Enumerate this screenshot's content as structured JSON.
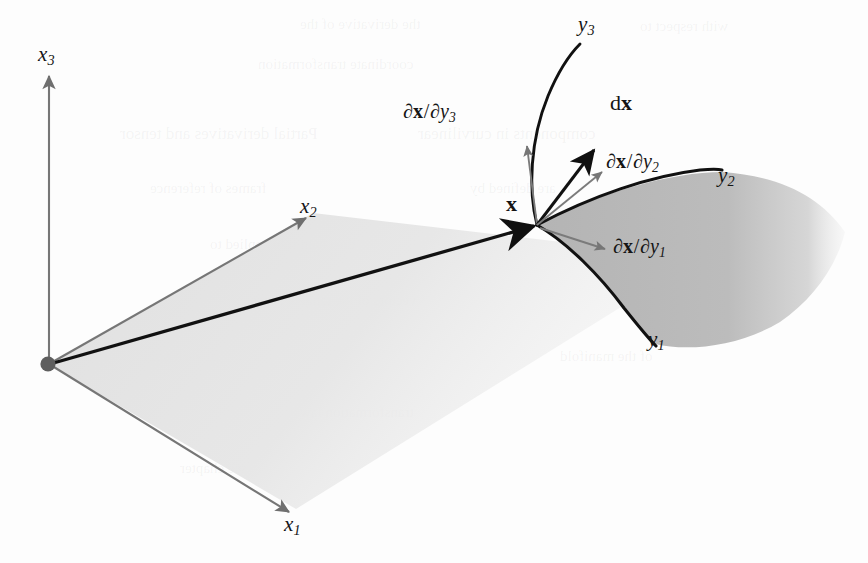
{
  "figure": {
    "kind": "mathematical-diagram",
    "background_color": "#fdfdfd",
    "ink_color": "#151515",
    "axis_color": "#6e6e6e",
    "surface_fill": "#b9b9b9",
    "plane_fill": "#e3e3e3"
  },
  "axes": [
    {
      "name": "x1",
      "base": "x",
      "sub": "1",
      "color": "#7a7a7a"
    },
    {
      "name": "x2",
      "base": "x",
      "sub": "2",
      "color": "#7a7a7a"
    },
    {
      "name": "x3",
      "base": "x",
      "sub": "3",
      "color": "#7a7a7a"
    }
  ],
  "labels": {
    "x1": {
      "base": "x",
      "sub": "1"
    },
    "x2": {
      "base": "x",
      "sub": "2"
    },
    "x3": {
      "base": "x",
      "sub": "3"
    },
    "y1": {
      "base": "y",
      "sub": "1"
    },
    "y2": {
      "base": "y",
      "sub": "2"
    },
    "y3": {
      "base": "y",
      "sub": "3"
    },
    "point_x": "x",
    "differential": {
      "d": "d",
      "vec": "x"
    },
    "tangent_1": {
      "partial": "∂",
      "vec": "x",
      "slash": "/",
      "denom_base": "y",
      "denom_sub": "1"
    },
    "tangent_2": {
      "partial": "∂",
      "vec": "x",
      "slash": "/",
      "denom_base": "y",
      "denom_sub": "2"
    },
    "tangent_3": {
      "partial": "∂",
      "vec": "x",
      "slash": "/",
      "denom_base": "y",
      "denom_sub": "3"
    }
  },
  "elements": {
    "origin_dot": "origin-point",
    "position_vector": "position-vector-x",
    "surface": "curved-coordinate-surface",
    "coordinate_plane": "x1-x2-coordinate-plane",
    "curve_y1": "coordinate-curve-y1",
    "curve_y2": "coordinate-curve-y2",
    "curve_y3": "coordinate-curve-y3"
  },
  "ghost_text": [
    {
      "text": "the derivative of the",
      "x": 300,
      "y": 16,
      "size": 15
    },
    {
      "text": "with respect to",
      "x": 640,
      "y": 18,
      "size": 15
    },
    {
      "text": "coordinate transformation",
      "x": 258,
      "y": 56,
      "size": 15
    },
    {
      "text": "Partial derivatives and tensor",
      "x": 120,
      "y": 124,
      "size": 17
    },
    {
      "text": "components in curvilinear",
      "x": 418,
      "y": 124,
      "size": 17
    },
    {
      "text": "frames of reference",
      "x": 150,
      "y": 180,
      "size": 15
    },
    {
      "text": "are defined by",
      "x": 470,
      "y": 180,
      "size": 15
    },
    {
      "text": "the chain rule applied to",
      "x": 210,
      "y": 236,
      "size": 15
    },
    {
      "text": "the basis",
      "x": 620,
      "y": 236,
      "size": 15
    },
    {
      "text": "vectors of the tangent space",
      "x": 250,
      "y": 292,
      "size": 15
    },
    {
      "text": "at each point",
      "x": 140,
      "y": 348,
      "size": 15
    },
    {
      "text": "of the manifold",
      "x": 560,
      "y": 348,
      "size": 15
    },
    {
      "text": "transformation law",
      "x": 300,
      "y": 404,
      "size": 15
    },
    {
      "text": "see chapter",
      "x": 180,
      "y": 460,
      "size": 15
    }
  ]
}
